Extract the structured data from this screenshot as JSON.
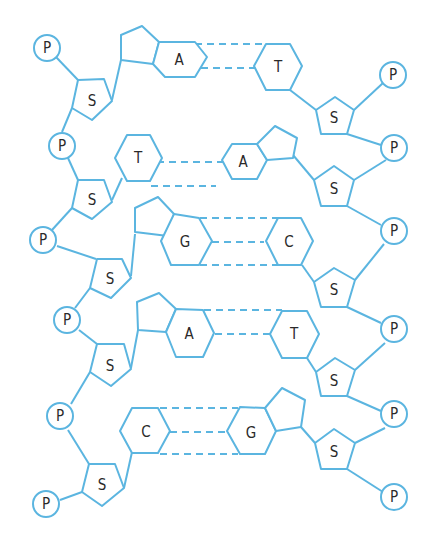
{
  "diagram": {
    "caption_partial": "",
    "line_color": "#5bb5e0",
    "phosphate_label": "P",
    "sugar_label": "S",
    "base_pairs": [
      {
        "left": "A",
        "right": "T",
        "hydrogen_bonds": 2
      },
      {
        "left": "T",
        "right": "A",
        "hydrogen_bonds": 2
      },
      {
        "left": "G",
        "right": "C",
        "hydrogen_bonds": 3
      },
      {
        "left": "A",
        "right": "T",
        "hydrogen_bonds": 2
      },
      {
        "left": "C",
        "right": "G",
        "hydrogen_bonds": 3
      }
    ],
    "left_strand": {
      "phosphates": [
        "P",
        "P",
        "P",
        "P",
        "P",
        "P"
      ],
      "sugars": [
        "S",
        "S",
        "S",
        "S",
        "S"
      ]
    },
    "right_strand": {
      "phosphates": [
        "P",
        "P",
        "P",
        "P",
        "P",
        "P"
      ],
      "sugars": [
        "S",
        "S",
        "S",
        "S",
        "S"
      ]
    }
  }
}
